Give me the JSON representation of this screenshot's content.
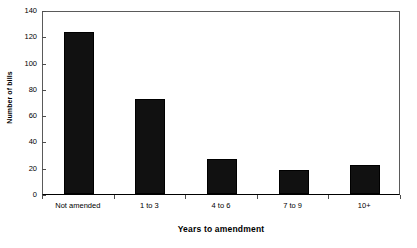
{
  "chart_data": {
    "type": "bar",
    "title": "",
    "xlabel": "Years to amendment",
    "ylabel": "Number of bills",
    "categories": [
      "Not amended",
      "1 to 3",
      "4 to 6",
      "7 to 9",
      "10+"
    ],
    "values": [
      123,
      72,
      27,
      18,
      22
    ],
    "ylim": [
      0,
      140
    ],
    "yticks": [
      0,
      20,
      40,
      60,
      80,
      100,
      120,
      140
    ],
    "ytick_labels": [
      "0",
      "20",
      "40",
      "60",
      "80",
      "100",
      "120",
      "140"
    ],
    "grid": false,
    "legend": false,
    "legend_position": "none",
    "series": [
      {
        "name": "Number of bills",
        "values": [
          123,
          72,
          27,
          18,
          22
        ],
        "color": "#111111"
      }
    ],
    "colors": {
      "bar_fill": "#111111",
      "bar_edge": "#000000",
      "axis": "#5a5a5a",
      "background": "#ffffff",
      "text": "#000000"
    }
  }
}
